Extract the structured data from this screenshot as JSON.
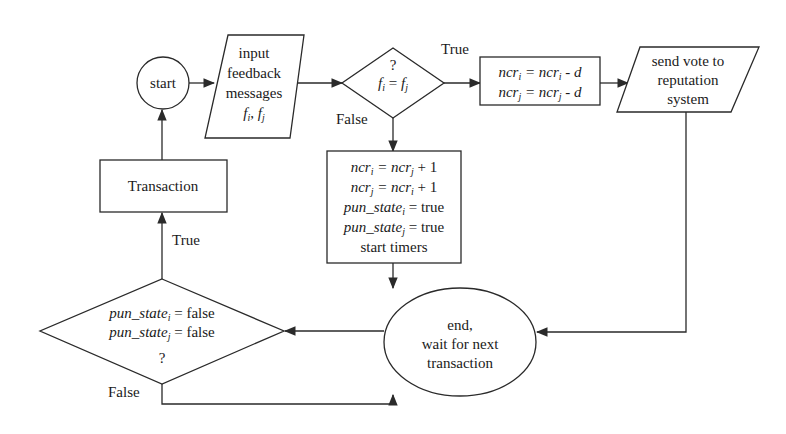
{
  "diagram": {
    "type": "flowchart",
    "nodes": {
      "start": {
        "shape": "circle",
        "label": "start"
      },
      "input": {
        "shape": "parallelogram",
        "lines": [
          "input",
          "feedback",
          "messages"
        ],
        "vars": {
          "a": "f",
          "a_sub": "i",
          "sep": ", ",
          "b": "f",
          "b_sub": "j"
        }
      },
      "decision_feedback": {
        "shape": "diamond",
        "question": "?",
        "lhs": "f",
        "lhs_sub": "i",
        "op": " = ",
        "rhs": "f",
        "rhs_sub": "j"
      },
      "penalize_votes": {
        "shape": "rectangle",
        "lines": [
          {
            "v": "ncr",
            "sub": "i",
            "rest": " = ncr",
            "sub2": "i",
            "tail": " - d"
          },
          {
            "v": "ncr",
            "sub": "j",
            "rest": " = ncr",
            "sub2": "j",
            "tail": " - d"
          }
        ]
      },
      "send_vote": {
        "shape": "parallelogram",
        "lines": [
          "send vote to",
          "reputation",
          "system"
        ]
      },
      "mismatch_update": {
        "shape": "rectangle",
        "lines": [
          {
            "v": "ncr",
            "sub": "i",
            "rest": " = ncr",
            "sub2": "j",
            "tail": " + 1"
          },
          {
            "v": "ncr",
            "sub": "j",
            "rest": " = ncr",
            "sub2": "i",
            "tail": " + 1"
          },
          {
            "v": "pun_state",
            "sub": "i",
            "tail": " = true"
          },
          {
            "v": "pun_state",
            "sub": "j",
            "tail": " = true"
          },
          {
            "plain": "start timers"
          }
        ]
      },
      "end": {
        "shape": "ellipse",
        "lines": [
          "end,",
          "wait for next",
          "transaction"
        ]
      },
      "decision_punish": {
        "shape": "diamond",
        "lines": [
          {
            "v": "pun_state",
            "sub": "i",
            "tail": " = false"
          },
          {
            "v": "pun_state",
            "sub": "j",
            "tail": " = false"
          }
        ],
        "question": "?"
      },
      "transaction": {
        "shape": "rectangle",
        "label": "Transaction"
      }
    },
    "edge_labels": {
      "feedback_true": "True",
      "feedback_false": "False",
      "punish_true": "True",
      "punish_false": "False"
    },
    "colors": {
      "stroke": "#2a2a2a",
      "text": "#1a1a1a",
      "background": "#ffffff"
    }
  }
}
